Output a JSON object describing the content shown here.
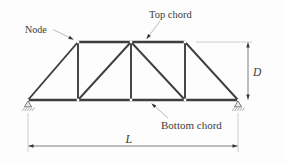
{
  "labels": {
    "node": "Node",
    "top_chord": "Top chord",
    "bottom_chord": "Bottom chord",
    "depth": "D",
    "span": "L"
  },
  "colors": {
    "background": "#fdfdfd",
    "member": "#3e3e3e",
    "leader_line": "#ababab",
    "dimension_line": "#6f6f6f",
    "extension_line": "#c2c2c2",
    "arrowhead": "#333333",
    "text": "#3c3c3c"
  }
}
